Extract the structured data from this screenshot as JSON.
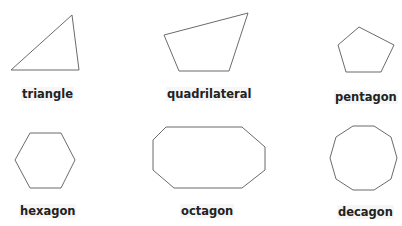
{
  "colors": {
    "background": "#ffffff",
    "stroke": "#6b6b6b",
    "label_text": "#222222",
    "label_background": "#f6f6f6"
  },
  "shapes": [
    {
      "name": "triangle",
      "label": "triangle",
      "sides": 3,
      "points": "11,70 72,15 79,70",
      "label_pos": {
        "left": 21,
        "top": 87
      }
    },
    {
      "name": "quadrilateral",
      "label": "quadrilateral",
      "sides": 4,
      "points": "164,35 248,13 229,71 179,71",
      "label_pos": {
        "left": 166,
        "top": 87
      }
    },
    {
      "name": "pentagon",
      "label": "pentagon",
      "sides": 5,
      "points": "359,27 394,45 381,72 346,72 338,45",
      "label_pos": {
        "left": 334,
        "top": 90
      }
    },
    {
      "name": "hexagon",
      "label": "hexagon",
      "sides": 6,
      "points": "30,133 61,133 75,160 61,188 30,188 15,160",
      "label_pos": {
        "left": 19,
        "top": 204
      }
    },
    {
      "name": "octagon",
      "label": "octagon",
      "sides": 8,
      "points": "166,127 242,127 265,147 265,170 242,188 174,188 153,170 153,140",
      "label_pos": {
        "left": 180,
        "top": 204
      }
    },
    {
      "name": "decagon",
      "label": "decagon",
      "sides": 10,
      "points": "353,126 374,126 391,137 397,158 391,179 374,190 353,190 336,179 330,158 336,137",
      "label_pos": {
        "left": 337,
        "top": 205
      }
    }
  ]
}
